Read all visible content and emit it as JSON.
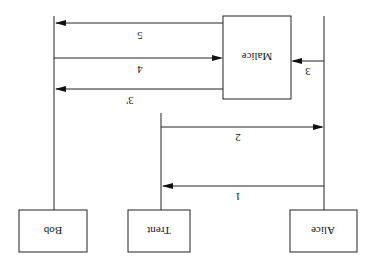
{
  "diagram": {
    "type": "sequence-diagram",
    "orientation": "rotated-180",
    "colors": {
      "stroke": "#222222",
      "text": "#111111",
      "background": "#ffffff"
    },
    "participants": [
      {
        "id": "bob",
        "label": "Bob"
      },
      {
        "id": "trent",
        "label": "Trent"
      },
      {
        "id": "alice",
        "label": "Alice"
      },
      {
        "id": "malice",
        "label": "Malice"
      }
    ],
    "messages": [
      {
        "label": "1",
        "from": "Alice",
        "to": "Trent"
      },
      {
        "label": "2",
        "from": "Trent",
        "to": "Alice"
      },
      {
        "label": "3",
        "from": "Alice",
        "to": "Malice"
      },
      {
        "label": "3'",
        "from": "Malice",
        "to": "Bob"
      },
      {
        "label": "4",
        "from": "Bob",
        "to": "Malice"
      },
      {
        "label": "5",
        "from": "Malice",
        "to": "Bob"
      }
    ]
  }
}
